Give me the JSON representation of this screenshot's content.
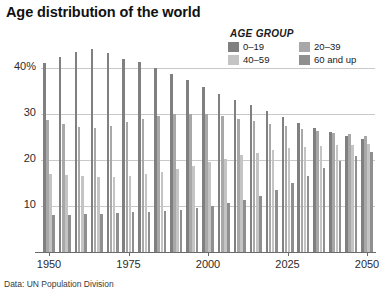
{
  "title": "Age distribution of the world",
  "source_note": "Data: UN Population Division",
  "legend": {
    "heading": "AGE GROUP",
    "entries": [
      {
        "label": "0–19",
        "color": "#808080"
      },
      {
        "label": "20–39",
        "color": "#a8a8a8"
      },
      {
        "label": "40–59",
        "color": "#c4c4c4"
      },
      {
        "label": "60 and up",
        "color": "#8f8f8f"
      }
    ]
  },
  "chart_data": {
    "type": "bar",
    "title": "Age distribution of the world",
    "subtitle": "",
    "xlabel": "",
    "ylabel": "",
    "ylim": [
      0,
      50
    ],
    "yticks": [
      10,
      20,
      30,
      40
    ],
    "ytick_labels": [
      "10",
      "20",
      "30",
      "40%"
    ],
    "xticks": [
      1950,
      1975,
      2000,
      2025,
      2050
    ],
    "xtick_labels": [
      "1950",
      "1975",
      "2000",
      "2025",
      "2050"
    ],
    "xlim": [
      1947.5,
      2052.5
    ],
    "grid": true,
    "grid_axis": "y",
    "legend_position": "top-right",
    "categories": [
      1950,
      1955,
      1960,
      1965,
      1970,
      1975,
      1980,
      1985,
      1990,
      1995,
      2000,
      2005,
      2010,
      2015,
      2020,
      2025,
      2030,
      2035,
      2040,
      2045,
      2050
    ],
    "series": [
      {
        "name": "0–19",
        "color": "#808080",
        "values": [
          41.0,
          42.5,
          43.4,
          44.2,
          43.3,
          42.0,
          41.2,
          40.0,
          38.7,
          37.4,
          35.8,
          34.3,
          33.0,
          31.9,
          30.6,
          29.3,
          28.0,
          27.0,
          26.1,
          25.3,
          24.6
        ]
      },
      {
        "name": "20–39",
        "color": "#a8a8a8",
        "values": [
          28.6,
          27.8,
          27.2,
          27.0,
          27.5,
          28.3,
          29.0,
          29.6,
          30.0,
          30.1,
          30.0,
          29.6,
          29.0,
          28.4,
          27.8,
          27.3,
          26.8,
          26.3,
          25.9,
          25.6,
          25.3
        ]
      },
      {
        "name": "40–59",
        "color": "#c4c4c4",
        "values": [
          17.0,
          16.7,
          16.5,
          16.3,
          16.4,
          16.6,
          16.9,
          17.4,
          18.0,
          18.7,
          19.5,
          20.3,
          21.0,
          21.6,
          22.2,
          22.6,
          22.9,
          23.1,
          23.2,
          23.3,
          23.4
        ]
      },
      {
        "name": "60 and up",
        "color": "#8f8f8f",
        "values": [
          8.0,
          8.1,
          8.2,
          8.3,
          8.4,
          8.6,
          8.8,
          9.0,
          9.2,
          9.5,
          10.0,
          10.6,
          11.2,
          12.2,
          13.5,
          15.0,
          16.6,
          18.3,
          19.8,
          20.9,
          21.7
        ]
      }
    ]
  }
}
